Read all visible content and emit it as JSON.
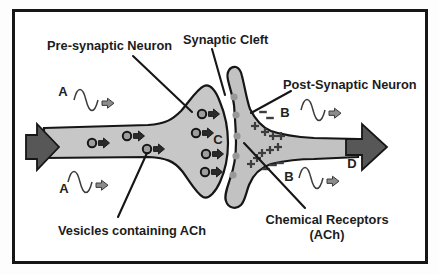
{
  "labels": {
    "pre_synaptic": "Pre-synaptic Neuron",
    "synaptic_cleft": "Synaptic Cleft",
    "post_synaptic": "Post-Synaptic Neuron",
    "vesicles": "Vesicles containing ACh",
    "receptors_line1": "Chemical Receptors",
    "receptors_line2": "(ACh)",
    "a_top": "A",
    "a_bottom": "A",
    "b_top": "B",
    "b_bottom": "B",
    "c": "C",
    "d": "D"
  },
  "colors": {
    "page_bg": "#fdfdfd",
    "frame_stroke": "#161616",
    "pre_neuron_fill": "#c7c7c7",
    "post_neuron_fill": "#c2c2c2",
    "outline": "#161616",
    "dark_arrow": "#575757",
    "vesicle_fill": "#9e9e9e",
    "vesicle_arrow": "#2a2a2a",
    "receptor_dot": "#989898",
    "charge": "#3d3d3d",
    "wave_stroke": "#3c3c3c",
    "wave_arrow": "#8c8c8c",
    "text": "#1c1c1c",
    "c_label": "#8f8f8f"
  },
  "glyphs": {
    "vesicles_axon": [
      [
        92,
        143
      ],
      [
        127,
        136
      ],
      [
        147,
        149
      ]
    ],
    "vesicles_terminal": [
      [
        202,
        114
      ],
      [
        196,
        133
      ],
      [
        206,
        154
      ],
      [
        205,
        172
      ]
    ],
    "receptor_dots": [
      [
        234,
        97
      ],
      [
        236,
        115
      ],
      [
        237,
        136
      ],
      [
        236,
        156
      ],
      [
        233,
        175
      ]
    ],
    "plus_signs": [
      [
        255,
        126
      ],
      [
        265,
        132
      ],
      [
        273,
        136
      ],
      [
        281,
        136
      ],
      [
        262,
        153
      ],
      [
        270,
        150
      ],
      [
        278,
        147
      ],
      [
        251,
        164
      ],
      [
        257,
        158
      ]
    ],
    "minus_signs": [
      [
        263,
        112
      ],
      [
        270,
        118
      ],
      [
        266,
        169
      ],
      [
        273,
        165
      ],
      [
        280,
        163
      ]
    ],
    "waves": [
      [
        74,
        100
      ],
      [
        68,
        182
      ],
      [
        301,
        110
      ],
      [
        299,
        178
      ]
    ]
  }
}
